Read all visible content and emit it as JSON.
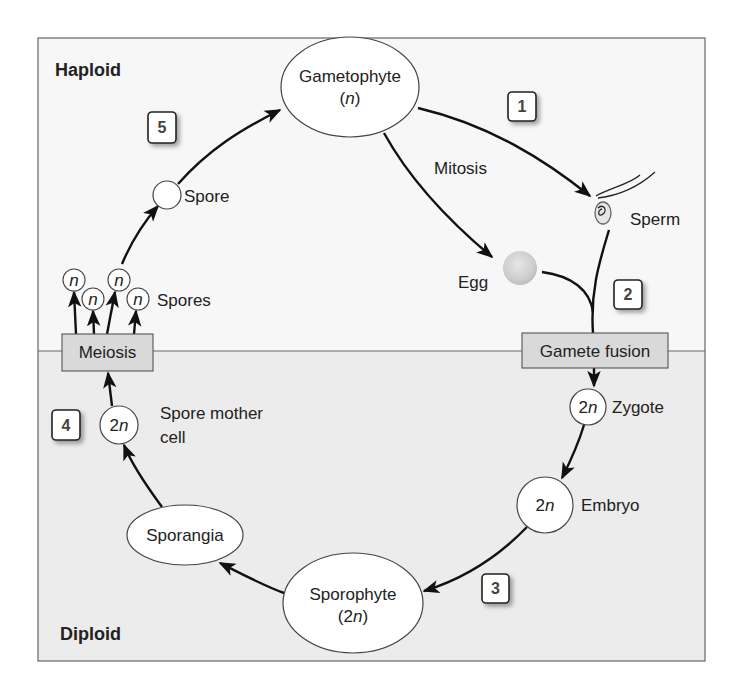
{
  "regions": {
    "haploid": {
      "label": "Haploid",
      "bg": "#f7f7f7"
    },
    "diploid": {
      "label": "Diploid",
      "bg": "#ececec"
    }
  },
  "colors": {
    "line": "#111111",
    "box_fill": "#d9d9d9",
    "node_fill": "#ffffff",
    "frame": "#666666"
  },
  "processes": {
    "meiosis": "Meiosis",
    "gamete_fusion": "Gamete fusion",
    "mitosis": "Mitosis"
  },
  "nodes": {
    "gametophyte": {
      "name": "Gametophyte",
      "ploidy_open": "(",
      "ploidy": "n",
      "ploidy_close": ")"
    },
    "sporophyte": {
      "name": "Sporophyte",
      "ploidy_open": "(2",
      "ploidy": "n",
      "ploidy_close": ")"
    },
    "sporangia": {
      "name": "Sporangia"
    },
    "spore": {
      "label": "Spore"
    },
    "spores": {
      "label": "Spores",
      "cell": "n"
    },
    "sperm": {
      "label": "Sperm"
    },
    "egg": {
      "label": "Egg"
    },
    "zygote": {
      "label": "Zygote",
      "num": "2",
      "ploidy": "n"
    },
    "embryo": {
      "label": "Embryo",
      "num": "2",
      "ploidy": "n"
    },
    "spore_mother_cell": {
      "label_line1": "Spore mother",
      "label_line2": "cell",
      "num": "2",
      "ploidy": "n"
    }
  },
  "steps": [
    "1",
    "2",
    "3",
    "4",
    "5"
  ]
}
